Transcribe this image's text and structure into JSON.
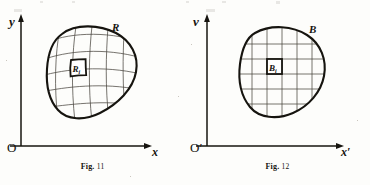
{
  "figures": [
    {
      "id": "fig-11",
      "caption_prefix": "Fig.",
      "caption_number": "11",
      "vertical_axis_label": "y",
      "horizontal_axis_label": "x",
      "origin_label": "O",
      "region_label": "R",
      "cell_label": "R",
      "cell_label_subscript": "i",
      "grid_type": "curvilinear",
      "grid_rows": 5,
      "grid_cols": 5
    },
    {
      "id": "fig-12",
      "caption_prefix": "Fig.",
      "caption_number": "12",
      "vertical_axis_label": "v",
      "horizontal_axis_label": "x′",
      "origin_label": "O′",
      "region_label": "B",
      "cell_label": "B",
      "cell_label_subscript": "i",
      "grid_type": "rectangular",
      "grid_rows": 5,
      "grid_cols": 5
    }
  ],
  "colors": {
    "ink": "#16140f",
    "grid_ink": "#4a463f",
    "paper": "#fdfdfb",
    "bleed": "#8d887f"
  }
}
